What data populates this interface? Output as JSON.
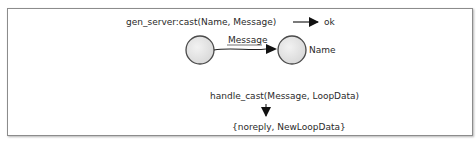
{
  "diagram": {
    "call_text": "gen_server:cast(Name, Message)",
    "result_text": "ok",
    "edge_label": "Message",
    "target_label": "Name",
    "handler_text": "handle_cast(Message, LoopData)",
    "return_text": "{noreply, NewLoopData}",
    "nodes": [
      {
        "id": "client-process",
        "label": ""
      },
      {
        "id": "server-process",
        "label": "Name"
      }
    ],
    "colors": {
      "node_fill": "#e9e9e9",
      "node_stroke": "#4a4a4a",
      "line": "#222222",
      "border": "#8c8c8c"
    }
  }
}
